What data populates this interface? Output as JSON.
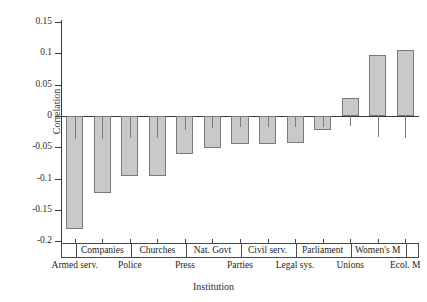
{
  "chart_data": {
    "type": "bar",
    "title": "",
    "xlabel": "Institution",
    "ylabel": "Correlation",
    "ylim": [
      -0.2,
      0.15
    ],
    "yticks": [
      0.15,
      0.1,
      0.05,
      0,
      -0.05,
      -0.1,
      -0.15,
      -0.2
    ],
    "ytick_labels": [
      "0.15",
      "0.1",
      "0.05",
      "0",
      "-0.05",
      "-0.1",
      "-0.15",
      "-0.2"
    ],
    "grid": false,
    "legend": "none",
    "categories": [
      "Armed serv.",
      "Companies",
      "Police",
      "Churches",
      "Press",
      "Nat. Govt",
      "Parties",
      "Civil serv.",
      "Legal sys.",
      "Parliament",
      "Unions",
      "Women's M",
      "Ecol. M"
    ],
    "values": [
      -0.18,
      -0.123,
      -0.095,
      -0.095,
      -0.06,
      -0.051,
      -0.045,
      -0.045,
      -0.043,
      -0.022,
      0.029,
      0.097,
      0.105
    ],
    "label_rows": [
      {
        "row": "bottom",
        "label": "Armed serv."
      },
      {
        "row": "top",
        "label": "Companies"
      },
      {
        "row": "bottom",
        "label": "Police"
      },
      {
        "row": "top",
        "label": "Churches"
      },
      {
        "row": "bottom",
        "label": "Press"
      },
      {
        "row": "top",
        "label": "Nat. Govt"
      },
      {
        "row": "bottom",
        "label": "Parties"
      },
      {
        "row": "top",
        "label": "Civil serv."
      },
      {
        "row": "bottom",
        "label": "Legal sys."
      },
      {
        "row": "top",
        "label": "Parliament"
      },
      {
        "row": "bottom",
        "label": "Unions"
      },
      {
        "row": "top",
        "label": "Women's M"
      },
      {
        "row": "bottom",
        "label": "Ecol. M"
      }
    ],
    "bar_color": "#c9c9c9",
    "bar_edge_color": "#7a7a7a",
    "axis_color": "#3a3a3a"
  }
}
